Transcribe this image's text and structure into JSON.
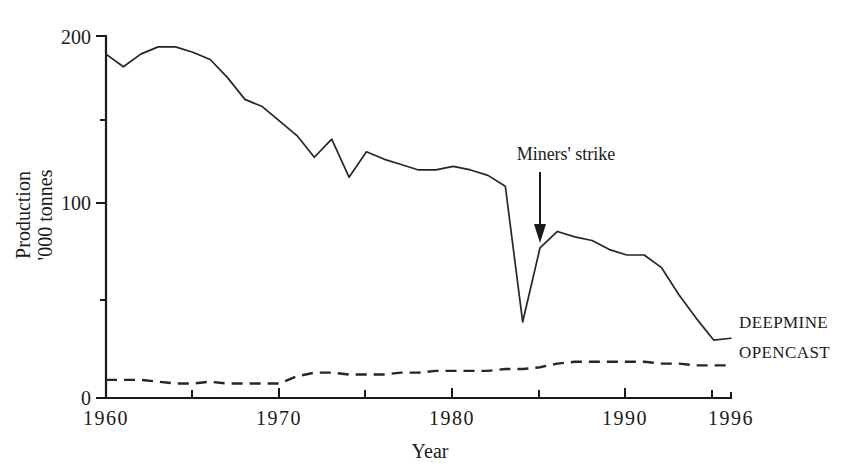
{
  "chart_data": {
    "type": "line",
    "title": "",
    "xlabel": "Year",
    "ylabel": "Production '000 tonnes",
    "ylabel_line1": "Production",
    "ylabel_line2": "'000 tonnes",
    "xlim": [
      1960,
      1996
    ],
    "ylim": [
      0,
      200
    ],
    "grid": false,
    "legend_position": "right-of-plot-end",
    "ytick_labels": [
      "0",
      "100",
      "200"
    ],
    "ytick_values": [
      0,
      100,
      200
    ],
    "yminor_tick_values": [
      50,
      150
    ],
    "xtick_labels": [
      "1960",
      "1970",
      "1980",
      "1990",
      "1996"
    ],
    "xtick_label_values": [
      1960,
      1970,
      1980,
      1990,
      1996
    ],
    "xtick_values": [
      1960,
      1965,
      1970,
      1975,
      1980,
      1985,
      1990,
      1995
    ],
    "x": [
      1960,
      1961,
      1962,
      1963,
      1964,
      1965,
      1966,
      1967,
      1968,
      1969,
      1970,
      1971,
      1972,
      1973,
      1974,
      1975,
      1976,
      1977,
      1978,
      1979,
      1980,
      1981,
      1982,
      1983,
      1984,
      1985,
      1986,
      1987,
      1988,
      1989,
      1990,
      1991,
      1992,
      1993,
      1994,
      1995,
      1996
    ],
    "series": [
      {
        "name": "DEEPMINE",
        "style": "solid",
        "label": "DEEPMINE",
        "values": [
          190,
          183,
          190,
          194,
          194,
          191,
          187,
          177,
          165,
          161,
          153,
          145,
          133,
          143,
          122,
          136,
          132,
          129,
          126,
          126,
          128,
          126,
          123,
          117,
          42,
          83,
          92,
          89,
          87,
          82,
          79,
          79,
          72,
          57,
          44,
          32,
          33
        ]
      },
      {
        "name": "OPENCAST",
        "style": "dashed",
        "label": "OPENCAST",
        "values": [
          10,
          10,
          10,
          9,
          8,
          8,
          9,
          8,
          8,
          8,
          8,
          12,
          14,
          14,
          13,
          13,
          13,
          14,
          14,
          15,
          15,
          15,
          15,
          16,
          16,
          17,
          19,
          20,
          20,
          20,
          20,
          20,
          19,
          19,
          18,
          18,
          18
        ]
      }
    ],
    "annotations": [
      {
        "text": "Miners' strike",
        "points_to_year": 1984,
        "type": "arrow-down"
      }
    ]
  }
}
